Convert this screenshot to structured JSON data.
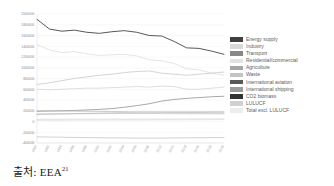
{
  "caption": {
    "source_label": "출처:",
    "source_value": "EEA",
    "source_footnote": "21"
  },
  "legend": {
    "position": "right",
    "items": [
      {
        "label": "Energy supply",
        "color": "#404040"
      },
      {
        "label": "Industry",
        "color": "#d9d9d9"
      },
      {
        "label": "Transport",
        "color": "#888888"
      },
      {
        "label": "Residential/commercial",
        "color": "#e2e2e2"
      },
      {
        "label": "Agriculture",
        "color": "#a6a6a6"
      },
      {
        "label": "Waste",
        "color": "#c4c4c4"
      },
      {
        "label": "International aviation",
        "color": "#595959"
      },
      {
        "label": "International shipping",
        "color": "#9b9b9b"
      },
      {
        "label": "CO2 biomass",
        "color": "#333333"
      },
      {
        "label": "LULUCF",
        "color": "#d0d0d0"
      },
      {
        "label": "Total excl. LULUCF",
        "color": "#ededed"
      }
    ]
  },
  "chart_data": {
    "type": "line",
    "title": "",
    "xlabel": "",
    "ylabel": "",
    "grid": true,
    "legend_position": "right",
    "ylim": [
      -400000,
      2000000
    ],
    "yticks": [
      2000000,
      1800000,
      1600000,
      1400000,
      1200000,
      1000000,
      800000,
      600000,
      400000,
      200000,
      0,
      -200000,
      -400000
    ],
    "ytick_labels": [
      "2000000",
      "1800000",
      "1600000",
      "1400000",
      "1200000",
      "1000000",
      "800000",
      "600000",
      "400000",
      "200000",
      "0",
      "-200000",
      "-400000"
    ],
    "categories": [
      "1990",
      "1992",
      "1994",
      "1996",
      "1998",
      "2000",
      "2002",
      "2004",
      "2006",
      "2008",
      "2010",
      "2012",
      "2014",
      "2016",
      "2018",
      "2019"
    ],
    "x": [
      1990,
      1992,
      1994,
      1996,
      1998,
      2000,
      2002,
      2004,
      2006,
      2008,
      2010,
      2012,
      2014,
      2016,
      2018,
      2019
    ],
    "series": [
      {
        "name": "Total excl. LULUCF",
        "color": "#454545",
        "width": 0.9,
        "values": [
          1900000,
          1720000,
          1680000,
          1700000,
          1660000,
          1640000,
          1670000,
          1690000,
          1660000,
          1600000,
          1590000,
          1490000,
          1370000,
          1360000,
          1310000,
          1250000
        ]
      },
      {
        "name": "Energy supply",
        "color": "#dedede",
        "width": 0.8,
        "values": [
          1430000,
          1330000,
          1280000,
          1300000,
          1260000,
          1230000,
          1240000,
          1250000,
          1220000,
          1150000,
          1130000,
          1080000,
          980000,
          960000,
          900000,
          860000
        ]
      },
      {
        "name": "Industry",
        "color": "#c9c9c9",
        "width": 0.8,
        "values": [
          690000,
          720000,
          760000,
          800000,
          830000,
          860000,
          880000,
          910000,
          930000,
          940000,
          900000,
          880000,
          860000,
          880000,
          900000,
          920000
        ]
      },
      {
        "name": "Transport",
        "color": "#d6d6d6",
        "width": 0.8,
        "values": [
          600000,
          590000,
          600000,
          610000,
          620000,
          620000,
          630000,
          640000,
          650000,
          640000,
          660000,
          650000,
          600000,
          600000,
          620000,
          640000
        ]
      },
      {
        "name": "Residential/commercial",
        "color": "#9e9e9e",
        "width": 0.9,
        "values": [
          190000,
          195000,
          200000,
          205000,
          215000,
          225000,
          240000,
          265000,
          295000,
          330000,
          380000,
          410000,
          430000,
          445000,
          460000,
          470000
        ]
      },
      {
        "name": "Agriculture",
        "color": "#b5b5b5",
        "width": 0.7,
        "values": [
          200000,
          198000,
          196000,
          193000,
          190000,
          188000,
          185000,
          182000,
          178000,
          175000,
          172000,
          170000,
          168000,
          166000,
          164000,
          162000
        ]
      },
      {
        "name": "Waste",
        "color": "#c0c0c0",
        "width": 0.7,
        "values": [
          130000,
          135000,
          140000,
          146000,
          152000,
          158000,
          163000,
          168000,
          172000,
          176000,
          178000,
          180000,
          181000,
          182000,
          183000,
          184000
        ]
      },
      {
        "name": "International aviation",
        "color": "#b0b0b0",
        "width": 0.6,
        "values": [
          140000,
          142000,
          143000,
          145000,
          146000,
          147000,
          147000,
          148000,
          148000,
          148000,
          147000,
          146000,
          145000,
          145000,
          144000,
          143000
        ]
      },
      {
        "name": "International shipping",
        "color": "#cccccc",
        "width": 0.6,
        "values": [
          40000,
          41000,
          42000,
          42000,
          43000,
          43000,
          44000,
          44000,
          45000,
          45000,
          45000,
          46000,
          46000,
          46000,
          47000,
          47000
        ]
      },
      {
        "name": "CO2 biomass",
        "color": "#dadada",
        "width": 0.6,
        "values": [
          20000,
          21000,
          22000,
          23000,
          24000,
          25000,
          26000,
          27000,
          28000,
          29000,
          30000,
          31000,
          32000,
          33000,
          34000,
          35000
        ]
      },
      {
        "name": "LULUCF",
        "color": "#bdbdbd",
        "width": 0.7,
        "values": [
          -285000,
          -290000,
          -292000,
          -296000,
          -300000,
          -302000,
          -305000,
          -306000,
          -308000,
          -310000,
          -308000,
          -306000,
          -304000,
          -302000,
          -300000,
          -298000
        ]
      }
    ]
  }
}
